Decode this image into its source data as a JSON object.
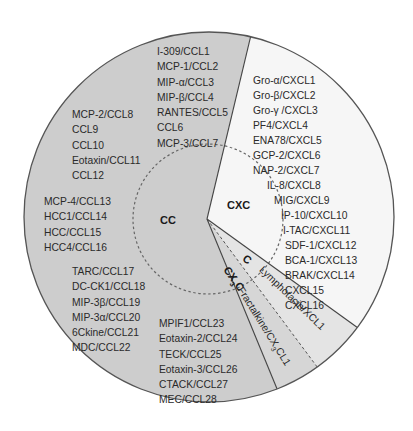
{
  "diagram": {
    "type": "pie",
    "title": "",
    "colors": {
      "CC": "#cdcdcd",
      "CXC": "#f6f6f6",
      "C": "#e4e4e4",
      "CX3C": "#d6d6d6",
      "outline": "#555555",
      "dashed": "#666666"
    },
    "groups": [
      {
        "label": "CC",
        "start_deg": 158.4,
        "end_deg": 373,
        "members": [
          "I-309/CCL1",
          "MCP-1/CCL2",
          "MIP-α/CCL3",
          "MIP-β/CCL4",
          "RANTES/CCL5",
          "CCL6",
          "MCP-3/CCL7",
          "MCP-2/CCL8",
          "CCL9",
          "CCL10",
          "Eotaxin/CCL11",
          "CCL12",
          "MCP-4/CCL13",
          "HCC1/CCL14",
          "HCC/CCL15",
          "HCC4/CCL16",
          "TARC/CCL17",
          "DC-CK1/CCL18",
          "MIP-3β/CCL19",
          "MIP-3α/CCL20",
          "6Ckine/CCL21",
          "MDC/CCL22",
          "MPIF1/CCL23",
          "Eotaxin-2/CCL24",
          "TECK/CCL25",
          "Eotaxin-3/CCL26",
          "CTACK/CCL27",
          "MEC/CCL28"
        ]
      },
      {
        "label": "CXC",
        "start_deg": 13,
        "end_deg": 126.7,
        "members": [
          "Gro-α/CXCL1",
          "Gro-β/CXCL2",
          "Gro-γ /CXCL3",
          "PF4/CXCL4",
          "ENA78/CXCL5",
          "GCP-2/CXCL6",
          "NAP-2/CXCL7",
          "IL-8/CXCL8",
          "MIG/CXCL9",
          "IP-10/CXCL10",
          "I-TAC/CXCL11",
          "SDF-1/CXCL12",
          "BCA-1/CXCL13",
          "BRAK/CXCL14",
          "CXCL15",
          "CXCL16"
        ]
      },
      {
        "label": "C",
        "start_deg": 126.7,
        "end_deg": 144.2,
        "members": [
          "Lymphotacin/XCL1"
        ]
      },
      {
        "label": "CX3C",
        "label_main": "CX",
        "label_sub": "3",
        "label_tail": "C",
        "start_deg": 144.2,
        "end_deg": 158.4,
        "members": [
          "Fractalkine/CX3CL1"
        ],
        "member_parts": {
          "pre": "Fractalkine/CX",
          "sub": "3",
          "post": "CL1"
        }
      }
    ],
    "cc_columns": {
      "top": [
        "I-309/CCL1",
        "MCP-1/CCL2",
        "MIP-α/CCL3",
        "MIP-β/CCL4",
        "RANTES/CCL5",
        "CCL6",
        "MCP-3/CCL7"
      ],
      "upper_left": [
        "MCP-2/CCL8",
        "CCL9",
        "CCL10",
        "Eotaxin/CCL11",
        "CCL12"
      ],
      "left": [
        "MCP-4/CCL13",
        "HCC1/CCL14",
        "HCC/CCL15",
        "HCC4/CCL16"
      ],
      "lower_left": [
        "TARC/CCL17",
        "DC-CK1/CCL18",
        "MIP-3β/CCL19",
        "MIP-3α/CCL20",
        "6Ckine/CCL21",
        "MDC/CCL22"
      ],
      "bottom": [
        "MPIF1/CCL23",
        "Eotaxin-2/CCL24",
        "TECK/CCL25",
        "Eotaxin-3/CCL26",
        "CTACK/CCL27",
        "MEC/CCL28"
      ]
    }
  }
}
